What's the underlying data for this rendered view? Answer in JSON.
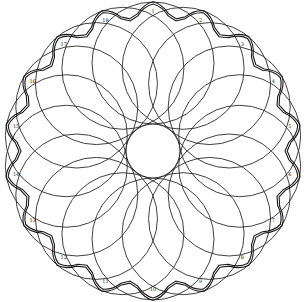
{
  "figure": {
    "title": "",
    "type": "rosette of overlapping circles with scalloped double border",
    "circle_count": 18,
    "labels": [
      "1",
      "2",
      "3",
      "4",
      "5",
      "6",
      "7",
      "8",
      "9",
      "10",
      "11",
      "12",
      "13",
      "14",
      "15",
      "16",
      "17",
      "18"
    ],
    "colors": {
      "line": "#2a2a2a",
      "background": "#ffffff"
    }
  }
}
